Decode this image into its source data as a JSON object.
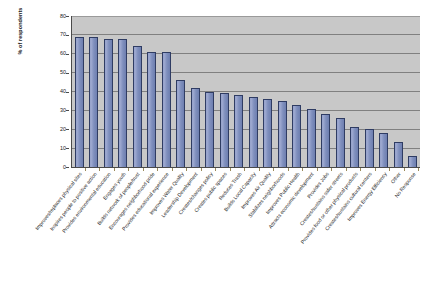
{
  "chart_data": {
    "type": "bar",
    "title": "",
    "xlabel": "",
    "ylabel": "% of respondents",
    "ylim": [
      0,
      80
    ],
    "ytick_step": 10,
    "yticks": [
      "0",
      "10",
      "20",
      "30",
      "40",
      "50",
      "60",
      "70",
      "80"
    ],
    "grid": true,
    "legend": "none",
    "plot_background": "#c8c8c8",
    "bar_fill": "#8290c0",
    "bar_border": "#2f3c63",
    "categories": [
      "Improves/replaces physical sites",
      "Inspires people to positive action",
      "Provides environmental education",
      "Engages youth",
      "Builds network of people/trust",
      "Encourages neighborhood pride",
      "Provides educational experience",
      "Improves Water Quality",
      "Leadership Development",
      "Creates/changes policy",
      "Creates public spaces",
      "Reduces Trash",
      "Builds Local Capacity",
      "Improves Air Quality",
      "Stabilizes neighborhoods",
      "Improves Public Health",
      "Attracts economic development",
      "Provides Jobs",
      "Creates/sustains safer streets",
      "Provides food or other physical products",
      "Creates/sustains cultural centers",
      "Improves Energy Efficiency",
      "Other",
      "No Response"
    ],
    "values": [
      69,
      69,
      68,
      68,
      64,
      61,
      61,
      46,
      42,
      40,
      39,
      38,
      37,
      36,
      35,
      33,
      31,
      28,
      26,
      21,
      20,
      18,
      13,
      6
    ]
  },
  "footer": {
    "note": ""
  }
}
